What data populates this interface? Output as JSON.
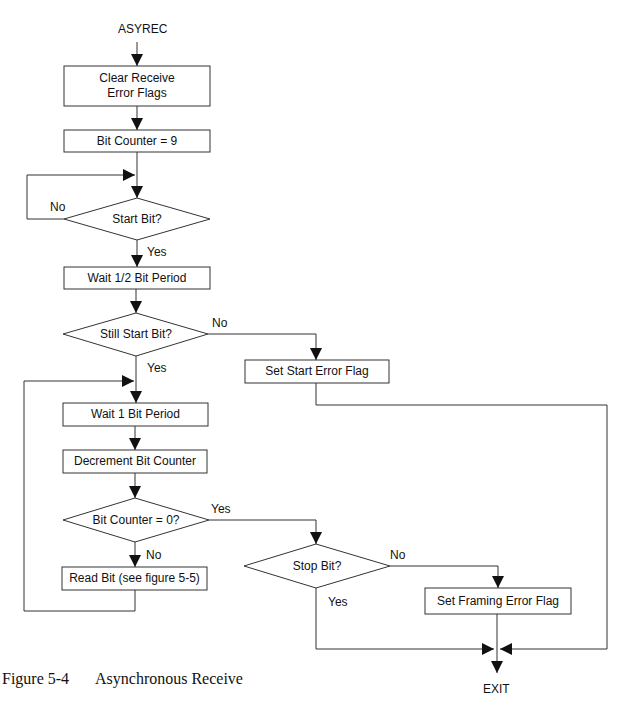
{
  "diagram": {
    "type": "flowchart",
    "start_label": "ASYREC",
    "end_label": "EXIT",
    "nodes": {
      "clear_flags": "Clear Receive Error Flags",
      "bit_counter_init": "Bit Counter = 9",
      "start_bit": "Start Bit?",
      "wait_half": "Wait 1/2 Bit Period",
      "still_start": "Still Start Bit?",
      "set_start_error": "Set Start Error Flag",
      "wait_one": "Wait 1 Bit Period",
      "decrement": "Decrement Bit Counter",
      "counter_zero": "Bit Counter = 0?",
      "read_bit": "Read Bit (see figure 5-5)",
      "stop_bit": "Stop Bit?",
      "set_framing_error": "Set Framing Error Flag"
    },
    "edge_labels": {
      "start_bit_no": "No",
      "start_bit_yes": "Yes",
      "still_start_no": "No",
      "still_start_yes": "Yes",
      "counter_zero_yes": "Yes",
      "counter_zero_no": "No",
      "stop_bit_no": "No",
      "stop_bit_yes": "Yes"
    },
    "edges": [
      {
        "from": "ASYREC",
        "to": "clear_flags"
      },
      {
        "from": "clear_flags",
        "to": "bit_counter_init"
      },
      {
        "from": "bit_counter_init",
        "to": "start_bit"
      },
      {
        "from": "start_bit",
        "to": "start_bit",
        "label": "No"
      },
      {
        "from": "start_bit",
        "to": "wait_half",
        "label": "Yes"
      },
      {
        "from": "wait_half",
        "to": "still_start"
      },
      {
        "from": "still_start",
        "to": "set_start_error",
        "label": "No"
      },
      {
        "from": "still_start",
        "to": "wait_one",
        "label": "Yes"
      },
      {
        "from": "wait_one",
        "to": "decrement"
      },
      {
        "from": "decrement",
        "to": "counter_zero"
      },
      {
        "from": "counter_zero",
        "to": "stop_bit",
        "label": "Yes"
      },
      {
        "from": "counter_zero",
        "to": "read_bit",
        "label": "No"
      },
      {
        "from": "read_bit",
        "to": "wait_one"
      },
      {
        "from": "stop_bit",
        "to": "set_framing_error",
        "label": "No"
      },
      {
        "from": "stop_bit",
        "to": "EXIT",
        "label": "Yes"
      },
      {
        "from": "set_framing_error",
        "to": "EXIT"
      },
      {
        "from": "set_start_error",
        "to": "EXIT"
      }
    ]
  },
  "caption": {
    "figure_number": "Figure 5-4",
    "title": "Asynchronous Receive"
  }
}
